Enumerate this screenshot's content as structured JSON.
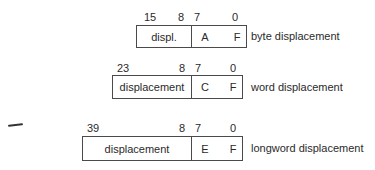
{
  "rows": [
    {
      "bits": {
        "high": "15",
        "mid_high": "8",
        "mid_low": "7",
        "low": "0"
      },
      "fields": {
        "disp": "displ.",
        "opcode": "A",
        "reg": "F"
      },
      "label": "byte displacement"
    },
    {
      "bits": {
        "high": "23",
        "mid_high": "8",
        "mid_low": "7",
        "low": "0"
      },
      "fields": {
        "disp": "displacement",
        "opcode": "C",
        "reg": "F"
      },
      "label": "word displacement"
    },
    {
      "bits": {
        "high": "39",
        "mid_high": "8",
        "mid_low": "7",
        "low": "0"
      },
      "fields": {
        "disp": "displacement",
        "opcode": "E",
        "reg": "F"
      },
      "label": "longword displacement"
    }
  ]
}
